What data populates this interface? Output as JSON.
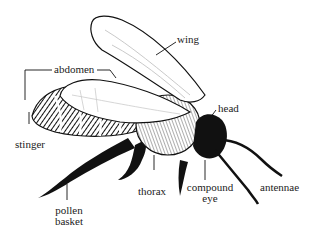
{
  "diagram": {
    "labels": {
      "wing": "wing",
      "abdomen": "abdomen",
      "head": "head",
      "stinger": "stinger",
      "thorax": "thorax",
      "compound_eye_line1": "compound",
      "compound_eye_line2": "eye",
      "antennae": "antennae",
      "pollen_basket_line1": "pollen",
      "pollen_basket_line2": "basket"
    },
    "colors": {
      "ink": "#111111",
      "background": "#ffffff"
    }
  }
}
